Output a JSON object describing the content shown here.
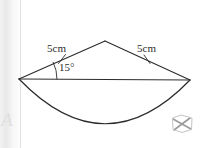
{
  "figure": {
    "type": "geometry-diagram",
    "background_color": "#ffffff",
    "stroke_color": "#2b2b2b",
    "labels": {
      "left_side": "5cm",
      "right_side": "5cm",
      "angle": "15°"
    },
    "watermark_letter": "A",
    "geometry": {
      "apex": [
        105,
        41
      ],
      "left_vertex": [
        19,
        79
      ],
      "right_vertex": [
        190,
        80
      ],
      "arc_bottom": [
        105,
        135
      ],
      "chord": [
        [
          19,
          79
        ],
        [
          190,
          80
        ]
      ],
      "left_radius": [
        [
          19,
          79
        ],
        [
          105,
          41
        ]
      ],
      "right_radius": [
        [
          105,
          41
        ],
        [
          190,
          80
        ]
      ],
      "tick_left": [
        62,
        59
      ],
      "tick_right": [
        147,
        59
      ],
      "angle_arc_center": [
        19,
        79
      ]
    }
  }
}
